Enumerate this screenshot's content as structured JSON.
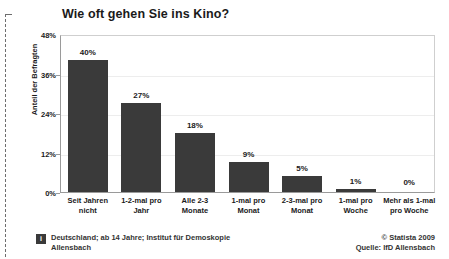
{
  "chart_data": {
    "type": "bar",
    "title": "Wie oft gehen Sie ins Kino?",
    "xlabel": "",
    "ylabel": "Anteil der Befragten",
    "ylim": [
      0,
      48
    ],
    "grid": true,
    "legend": "none",
    "categories": [
      "Seit Jahren nicht",
      "1-2-mal pro Jahr",
      "Alle 2-3 Monate",
      "1-mal pro Monat",
      "2-3-mal pro Monat",
      "1-mal pro Woche",
      "Mehr als 1-mal pro Woche"
    ],
    "values": [
      40,
      27,
      18,
      9,
      5,
      1,
      0
    ],
    "value_labels": [
      "40%",
      "27%",
      "18%",
      "9%",
      "5%",
      "1%",
      "0%"
    ],
    "ticks": [
      {
        "value": 48,
        "label": "48%"
      },
      {
        "value": 36,
        "label": "36%"
      },
      {
        "value": 24,
        "label": "24%"
      },
      {
        "value": 12,
        "label": "12%"
      },
      {
        "value": 0,
        "label": "0%"
      }
    ],
    "bar_color": "#3a3a3a",
    "background_color": "#ffffff",
    "gridline_color": "#ededed"
  },
  "footer": {
    "info_icon_glyph": "i",
    "note": "Deutschland; ab 14 Jahre; Institut für Demoskopie Allensbach",
    "copyright": "© Statista 2009",
    "source": "Quelle: IfD Allensbach"
  }
}
